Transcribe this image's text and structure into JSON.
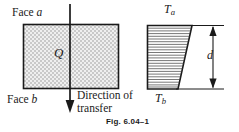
{
  "figure": {
    "caption": "Fig. 6.04–1",
    "colors": {
      "line": "#1a1a1a",
      "block_fill": "#e8e8e8",
      "background": "#ffffff",
      "hatch": "#4d4d4d"
    },
    "left_diagram": {
      "name": "conducting-slab",
      "top_face_label": "Face ",
      "top_face_symbol": "a",
      "bottom_face_label": "Face ",
      "bottom_face_symbol": "b",
      "heat_symbol": "Q",
      "arrow_caption_line1": "Direction of",
      "arrow_caption_line2": "transfer"
    },
    "right_diagram": {
      "name": "temperature-profile",
      "top_temperature": "T",
      "top_temperature_sub": "a",
      "bottom_temperature": "T",
      "bottom_temperature_sub": "b",
      "thickness_symbol": "d",
      "hatch_line_count": 24
    }
  }
}
